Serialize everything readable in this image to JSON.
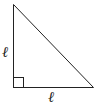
{
  "diagram": {
    "type": "right-isosceles-triangle",
    "labels": {
      "vertical_leg": "ℓ",
      "horizontal_leg": "ℓ"
    },
    "right_angle_marker": true,
    "colors": {
      "stroke": "#222222",
      "background": "#ffffff"
    }
  }
}
